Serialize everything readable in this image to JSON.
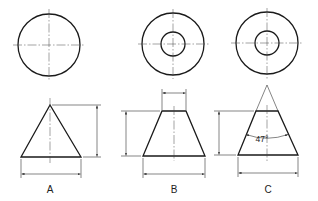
{
  "figures": [
    {
      "id": "A",
      "label": "A",
      "description": "Cone: plan view circle, elevation triangle with height and base diameter dimensions"
    },
    {
      "id": "B",
      "label": "B",
      "description": "Frustum: plan view concentric circles, elevation trapezoid with top width, height and base diameter dimensions"
    },
    {
      "id": "C",
      "label": "C",
      "description": "Frustum derived from cone: plan view concentric circles, elevation with apex construction lines, included angle, height and base diameter dimensions",
      "angle_label": "47°"
    }
  ],
  "colors": {
    "line": "#1a1a1a",
    "background": "#ffffff"
  }
}
